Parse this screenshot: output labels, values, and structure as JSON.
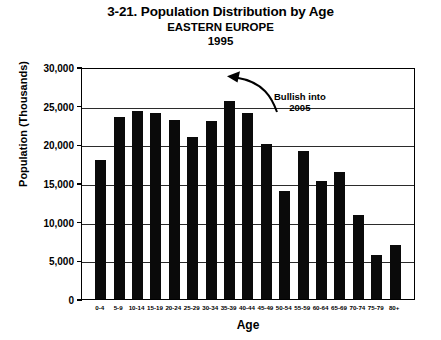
{
  "chart_data": {
    "type": "bar",
    "title": "3-21. Population Distribution by Age",
    "subtitle": "EASTERN EUROPE",
    "year": "1995",
    "xlabel": "Age",
    "ylabel": "Population (Thousands)",
    "grid": true,
    "legend": "none",
    "ylim": [
      0,
      30000
    ],
    "ytick_values": [
      30000,
      25000,
      20000,
      15000,
      10000,
      5000,
      0
    ],
    "ytick_labels": [
      "30,000",
      "25,000",
      "20,000",
      "15,000",
      "10,000",
      "5,000",
      "0"
    ],
    "categories": [
      "0-4",
      "5-9",
      "10-14",
      "15-19",
      "20-24",
      "25-29",
      "30-34",
      "35-39",
      "40-44",
      "45-49",
      "50-54",
      "55-59",
      "60-64",
      "65-69",
      "70-74",
      "75-79",
      "80+"
    ],
    "values": [
      18000,
      23500,
      24300,
      24000,
      23200,
      21000,
      23000,
      25600,
      24000,
      20000,
      14000,
      19200,
      15200,
      16400,
      10800,
      5700,
      7000
    ],
    "annotations": [
      {
        "text_line1": "Bullish into",
        "text_line2": "2005",
        "points_to": "35-39"
      }
    ]
  },
  "colors": {
    "bar": "#0a0a0a",
    "axis": "#000000",
    "grid": "#2b2b2b",
    "background": "#ffffff"
  }
}
